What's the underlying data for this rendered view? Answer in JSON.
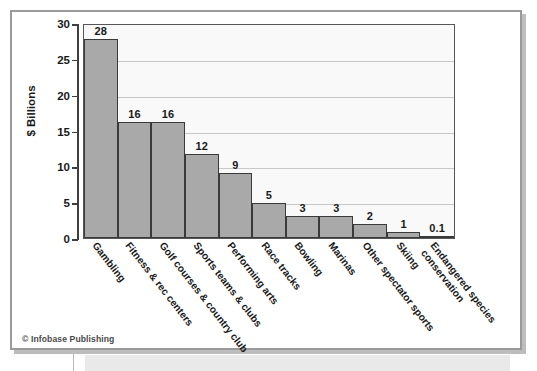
{
  "figure": {
    "credit": "© Infobase Publishing"
  },
  "chart_data": {
    "type": "bar",
    "title": "",
    "xlabel": "",
    "ylabel": "$ Billions",
    "ylim": [
      0,
      30
    ],
    "yticks": [
      0,
      5,
      10,
      15,
      20,
      25,
      30
    ],
    "ytick_labels": [
      "0",
      "5",
      "10",
      "15",
      "20",
      "25",
      "30"
    ],
    "grid": true,
    "legend": "none",
    "bar_fill_color": "#a9a9a9",
    "bar_edge_color": "#3a3a3a",
    "plot_background_color": "#f9f9f9",
    "categories": [
      "Gambling",
      "Fitness & rec centers",
      "Golf courses & country club",
      "Sports teams & clubs",
      "Performing arts",
      "Race tracks",
      "Bowling",
      "Marinas",
      "Other spectator sports",
      "Skiing",
      "Endangered species conservation"
    ],
    "category_lines": [
      [
        "Gambling"
      ],
      [
        "Fitness & rec centers"
      ],
      [
        "Golf courses & country club"
      ],
      [
        "Sports teams & clubs"
      ],
      [
        "Performing arts"
      ],
      [
        "Race tracks"
      ],
      [
        "Bowling"
      ],
      [
        "Marinas"
      ],
      [
        "Other spectator sports"
      ],
      [
        "Skiing"
      ],
      [
        "Endangered species",
        "conservation"
      ]
    ],
    "values": [
      28,
      16,
      16,
      12,
      9,
      5,
      3,
      3,
      2,
      1,
      0.1
    ],
    "value_labels": [
      "28",
      "16",
      "16",
      "12",
      "9",
      "5",
      "3",
      "3",
      "2",
      "1",
      "0.1"
    ],
    "drawn_heights": [
      27.7,
      16.2,
      16.2,
      11.7,
      9.1,
      4.9,
      3.1,
      3.1,
      2.0,
      0.9,
      0.25
    ]
  }
}
